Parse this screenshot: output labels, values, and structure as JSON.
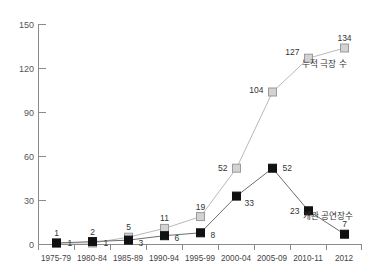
{
  "chart_data": {
    "type": "line",
    "title": "",
    "xlabel": "",
    "ylabel": "",
    "ylim": [
      0,
      150
    ],
    "yticks": [
      0,
      30,
      60,
      90,
      120,
      150
    ],
    "grid": false,
    "legend_position": "inline-annotation",
    "categories": [
      "1975-79",
      "1980-84",
      "1985-89",
      "1990-94",
      "1995-99",
      "2000-04",
      "2005-09",
      "2010-11",
      "2012"
    ],
    "series": [
      {
        "name": "누적 극장 수",
        "marker": "gray-square",
        "color": "#d2d2d2",
        "values": [
          1,
          1,
          5,
          11,
          19,
          52,
          104,
          127,
          134
        ]
      },
      {
        "name": "개관 공연장수",
        "marker": "black-square",
        "color": "#111111",
        "values": [
          1,
          2,
          3,
          6,
          8,
          33,
          52,
          23,
          7
        ]
      }
    ],
    "annotations": [
      {
        "text": "누적 극장 수",
        "series": "누적 극장 수"
      },
      {
        "text": "개관 공연장수",
        "series": "개관 공연장수"
      }
    ]
  },
  "axis": {
    "y_labels": [
      "150",
      "120",
      "90",
      "60",
      "30",
      "0"
    ],
    "x_labels": [
      "1975-79",
      "1980-84",
      "1985-89",
      "1990-94",
      "1995-99",
      "2000-04",
      "2005-09",
      "2010-11",
      "2012"
    ]
  },
  "point_labels": {
    "gray": [
      "1",
      "1",
      "5",
      "11",
      "19",
      "52",
      "104",
      "127",
      "134"
    ],
    "black": [
      "1",
      "2",
      "3",
      "6",
      "8",
      "33",
      "52",
      "23",
      "7"
    ]
  }
}
